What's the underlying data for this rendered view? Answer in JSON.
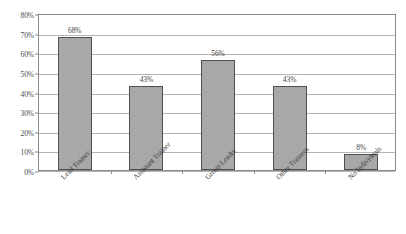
{
  "chart_data": {
    "type": "bar",
    "title": "",
    "subtitle": "",
    "xlabel": "",
    "ylabel": "",
    "categories": [
      "Lead Trainer",
      "Assistant Trainer",
      "Group Leader",
      "Other Trainees",
      "No Individuals"
    ],
    "values": [
      68,
      43,
      56,
      43,
      8
    ],
    "value_labels": [
      "68%",
      "43%",
      "56%",
      "43%",
      "8%"
    ],
    "ylim": [
      0,
      80
    ],
    "ytick_step": 10,
    "ytick_labels": [
      "0%",
      "10%",
      "20%",
      "30%",
      "40%",
      "50%",
      "60%",
      "70%",
      "80%"
    ],
    "ytick_values": [
      0,
      10,
      20,
      30,
      40,
      50,
      60,
      70,
      80
    ],
    "grid": true,
    "legend": false,
    "legend_position": "none",
    "colors": {
      "bar_fill": "#a8a8a8",
      "bar_border": "#4f4f4f",
      "gridline": "#b4b4b4",
      "axis": "#8a8a8a",
      "text": "#3f3f3f",
      "background": "#ffffff"
    }
  }
}
